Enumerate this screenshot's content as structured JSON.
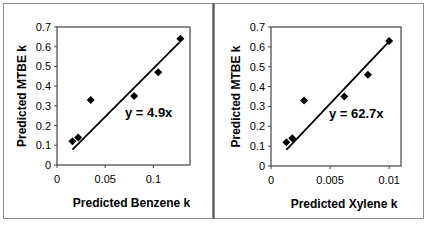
{
  "chart_data": [
    {
      "type": "scatter",
      "title": "",
      "xlabel": "Predicted Benzene k",
      "ylabel": "Predicted MTBE k",
      "xlim": [
        0,
        0.138
      ],
      "ylim": [
        0,
        0.7
      ],
      "x_ticks": [
        "0",
        "0.05",
        "0.1"
      ],
      "x_tick_values": [
        0,
        0.05,
        0.1
      ],
      "y_ticks": [
        "0",
        "0.1",
        "0.2",
        "0.3",
        "0.4",
        "0.5",
        "0.6",
        "0.7"
      ],
      "y_tick_values": [
        0,
        0.1,
        0.2,
        0.3,
        0.4,
        0.5,
        0.6,
        0.7
      ],
      "grid": false,
      "legend": "none",
      "series": [
        {
          "name": "data",
          "marker": "diamond",
          "x": [
            0.016,
            0.022,
            0.035,
            0.08,
            0.105,
            0.128
          ],
          "y": [
            0.12,
            0.14,
            0.33,
            0.35,
            0.47,
            0.64
          ]
        }
      ],
      "trendline": {
        "equation": "y = 4.9x",
        "slope": 4.9,
        "x_start": 0.016,
        "x_end": 0.127
      },
      "annotations": [
        "y = 4.9x"
      ]
    },
    {
      "type": "scatter",
      "title": "",
      "xlabel": "Predicted Xylene k",
      "ylabel": "Predicted MTBE k",
      "xlim": [
        0,
        0.011
      ],
      "ylim": [
        0,
        0.7
      ],
      "x_ticks": [
        "0",
        "0.005",
        "0.01"
      ],
      "x_tick_values": [
        0,
        0.005,
        0.01
      ],
      "y_ticks": [
        "0",
        "0.1",
        "0.2",
        "0.3",
        "0.4",
        "0.5",
        "0.6",
        "0.7"
      ],
      "y_tick_values": [
        0,
        0.1,
        0.2,
        0.3,
        0.4,
        0.5,
        0.6,
        0.7
      ],
      "grid": false,
      "legend": "none",
      "series": [
        {
          "name": "data",
          "marker": "diamond",
          "x": [
            0.0013,
            0.0018,
            0.0028,
            0.0062,
            0.0082,
            0.01
          ],
          "y": [
            0.12,
            0.14,
            0.33,
            0.35,
            0.46,
            0.63
          ]
        }
      ],
      "trendline": {
        "equation": "y = 62.7x",
        "slope": 62.7,
        "x_start": 0.0013,
        "x_end": 0.0099
      },
      "annotations": [
        "y = 62.7x"
      ]
    }
  ]
}
